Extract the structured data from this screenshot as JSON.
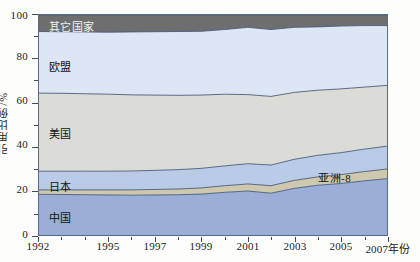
{
  "chart_data": {
    "type": "area",
    "stacked": true,
    "title": "",
    "xlabel": "年份",
    "ylabel": "引用比例/%",
    "xlim": [
      1992,
      2007
    ],
    "ylim": [
      0,
      100
    ],
    "grid": false,
    "legend_position": "inline-labels",
    "x": [
      1992,
      1993,
      1994,
      1995,
      1996,
      1997,
      1998,
      1999,
      2000,
      2001,
      2002,
      2003,
      2004,
      2005,
      2006,
      2007
    ],
    "x_ticks": [
      1992,
      1995,
      1997,
      1999,
      2001,
      2003,
      2005,
      2007
    ],
    "x_tick_labels": [
      "1992",
      "1995",
      "1997",
      "1999",
      "2001",
      "2003",
      "2005",
      "2007年份"
    ],
    "y_ticks": [
      0,
      20,
      40,
      60,
      80,
      100
    ],
    "y_tick_labels": [
      "0",
      "20",
      "40",
      "60",
      "80",
      "100"
    ],
    "y_minor_ticks": [
      10,
      30,
      50,
      70,
      90
    ],
    "series": [
      {
        "name": "中国",
        "color": "#9aaed8",
        "order": 1,
        "values": [
          18.5,
          18.4,
          18.3,
          18.2,
          18.1,
          18.2,
          18.3,
          18.6,
          19.4,
          20.0,
          19.0,
          21.2,
          22.6,
          23.4,
          24.6,
          25.6
        ]
      },
      {
        "name": "亚洲-8",
        "color": "#cdc8ae",
        "order": 2,
        "values": [
          2.0,
          2.1,
          2.2,
          2.3,
          2.4,
          2.5,
          2.6,
          2.8,
          3.0,
          3.2,
          3.4,
          3.6,
          3.8,
          4.0,
          4.2,
          4.4
        ]
      },
      {
        "name": "日本",
        "color": "#b9cbe6",
        "order": 3,
        "values": [
          8.5,
          8.5,
          8.5,
          8.5,
          8.6,
          8.7,
          8.8,
          8.9,
          9.0,
          9.2,
          9.4,
          9.6,
          9.8,
          10.0,
          10.2,
          10.4
        ]
      },
      {
        "name": "美国",
        "color": "#dcdcd6",
        "order": 4,
        "values": [
          35.5,
          35.4,
          35.2,
          35.0,
          34.6,
          34.2,
          33.8,
          33.3,
          32.6,
          31.4,
          31.2,
          30.4,
          29.6,
          29.0,
          28.2,
          27.6
        ]
      },
      {
        "name": "欧盟",
        "color": "#dce6f4",
        "order": 5,
        "values": [
          28.0,
          28.0,
          28.1,
          28.2,
          28.6,
          28.8,
          29.0,
          29.0,
          29.4,
          30.6,
          30.4,
          29.6,
          28.8,
          28.6,
          28.0,
          27.2
        ]
      },
      {
        "name": "其它国家",
        "color": "#6e6e6e",
        "order": 6,
        "values": [
          7.5,
          7.6,
          7.7,
          7.8,
          7.7,
          7.6,
          7.5,
          7.4,
          6.6,
          5.6,
          6.6,
          5.6,
          5.4,
          5.0,
          4.8,
          4.8
        ]
      }
    ],
    "series_labels": [
      {
        "text": "其它国家",
        "x_pct": 3,
        "y_pct": 95,
        "style": "light"
      },
      {
        "text": "欧盟",
        "x_pct": 3,
        "y_pct": 77,
        "style": "dark"
      },
      {
        "text": "美国",
        "x_pct": 3,
        "y_pct": 47,
        "style": "dark"
      },
      {
        "text": "日本",
        "x_pct": 3,
        "y_pct": 23,
        "style": "dark"
      },
      {
        "text": "中国",
        "x_pct": 3,
        "y_pct": 9,
        "style": "dark"
      },
      {
        "text": "亚洲-8",
        "x_pct": 80,
        "y_pct": 27,
        "style": "dark"
      }
    ],
    "colors": {
      "china": "#9aaed8",
      "asia8": "#cdc8ae",
      "japan": "#b9cbe6",
      "usa": "#dcdcd6",
      "eu": "#dce6f4",
      "other": "#6e6e6e",
      "axis": "#5a6a86",
      "outline": "#4a5b7a",
      "text": "#1a1a1a"
    }
  }
}
